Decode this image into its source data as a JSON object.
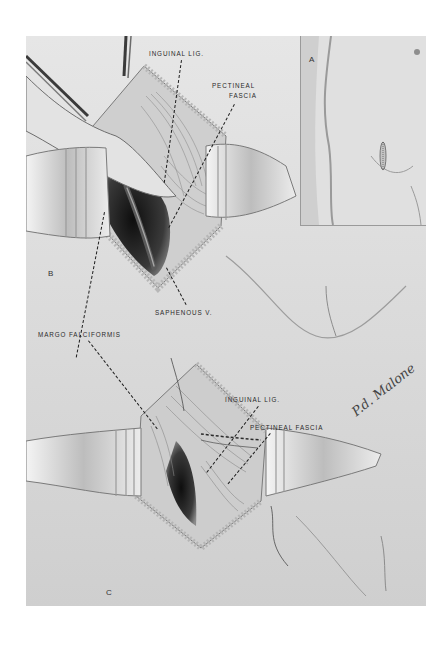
{
  "figure": {
    "panels": {
      "a": {
        "letter": "A"
      },
      "b": {
        "letter": "B",
        "labels": {
          "inguinal_lig": "INGUINAL LIG.",
          "pectineal_fascia_line1": "PECTINEAL",
          "pectineal_fascia_line2": "FASCIA",
          "saphenous_v": "SAPHENOUS V."
        }
      },
      "c": {
        "letter": "C",
        "labels": {
          "margo_falciformis": "MARGO FALCIFORMIS",
          "inguinal_lig": "INGUINAL LIG.",
          "pectineal_fascia": "PECTINEAL FASCIA"
        }
      }
    },
    "signature": "P.d. Malone",
    "colors": {
      "background": "#ffffff",
      "plate": "#e9e9e9",
      "tissue_dark": "#1c1c1c",
      "skin_light": "#dcdcdc",
      "label_text": "#2a2a2a"
    }
  }
}
